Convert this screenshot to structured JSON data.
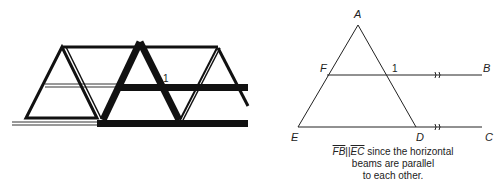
{
  "left_figure": {
    "description": "bridge truss",
    "angle_label": "1"
  },
  "right_figure": {
    "points": {
      "A": "A",
      "B": "B",
      "C": "C",
      "D": "D",
      "E": "E",
      "F": "F"
    },
    "angle_label": "1",
    "parallel_marks": "))"
  },
  "caption": {
    "seg1": "FB",
    "parallel_symbol": "||",
    "seg2": "EC",
    "line1_rest": " since the horizontal",
    "line2": "beams are parallel",
    "line3": "to each other."
  }
}
